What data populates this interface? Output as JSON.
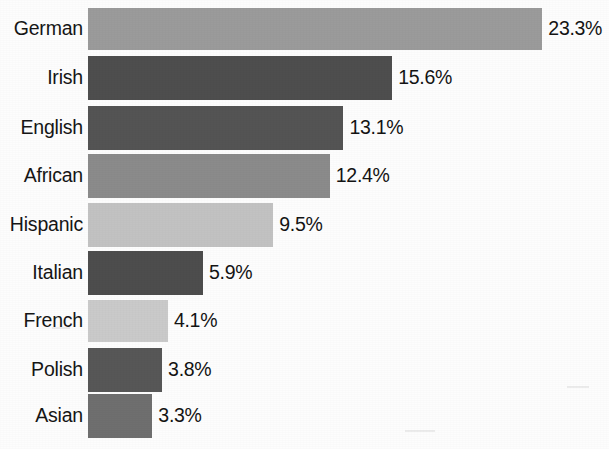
{
  "chart_data": {
    "type": "bar",
    "orientation": "horizontal",
    "title": "",
    "subtitle": "",
    "xlabel": "",
    "ylabel": "",
    "grid": false,
    "legend": false,
    "xlim": [
      0,
      25
    ],
    "categories": [
      "German",
      "Irish",
      "English",
      "African",
      "Hispanic",
      "Italian",
      "French",
      "Polish",
      "Asian"
    ],
    "values": [
      23.3,
      15.6,
      13.1,
      12.4,
      9.5,
      5.9,
      4.1,
      3.8,
      3.3
    ],
    "value_labels": [
      "23.3%",
      "15.6%",
      "13.1%",
      "12.4%",
      "9.5%",
      "5.9%",
      "4.1%",
      "3.8%",
      "3.3%"
    ],
    "bar_colors": [
      "#9b9b9b",
      "#4e4e4e",
      "#545454",
      "#8b8b8b",
      "#c2c2c2",
      "#4d4d4d",
      "#cacaca",
      "#575757",
      "#6f6f6f"
    ],
    "bars": [
      {
        "label": "German",
        "value": 23.3,
        "value_label": "23.3%",
        "color": "#9b9b9b"
      },
      {
        "label": "Irish",
        "value": 15.6,
        "value_label": "15.6%",
        "color": "#4e4e4e"
      },
      {
        "label": "English",
        "value": 13.1,
        "value_label": "13.1%",
        "color": "#545454"
      },
      {
        "label": "African",
        "value": 12.4,
        "value_label": "12.4%",
        "color": "#8b8b8b"
      },
      {
        "label": "Hispanic",
        "value": 9.5,
        "value_label": "9.5%",
        "color": "#c2c2c2"
      },
      {
        "label": "Italian",
        "value": 5.9,
        "value_label": "5.9%",
        "color": "#4d4d4d"
      },
      {
        "label": "French",
        "value": 4.1,
        "value_label": "4.1%",
        "color": "#cacaca"
      },
      {
        "label": "Polish",
        "value": 3.8,
        "value_label": "3.8%",
        "color": "#575757"
      },
      {
        "label": "Asian",
        "value": 3.3,
        "value_label": "3.3%",
        "color": "#6f6f6f"
      }
    ]
  },
  "layout": {
    "bar_origin_x": 92,
    "px_per_unit": 19.5,
    "row_tops": [
      8,
      56,
      106,
      154,
      203,
      251,
      300,
      348,
      394
    ],
    "row_heights": [
      42,
      44,
      44,
      44,
      44,
      44,
      42,
      44,
      44
    ],
    "background": "#fdfdfd"
  }
}
